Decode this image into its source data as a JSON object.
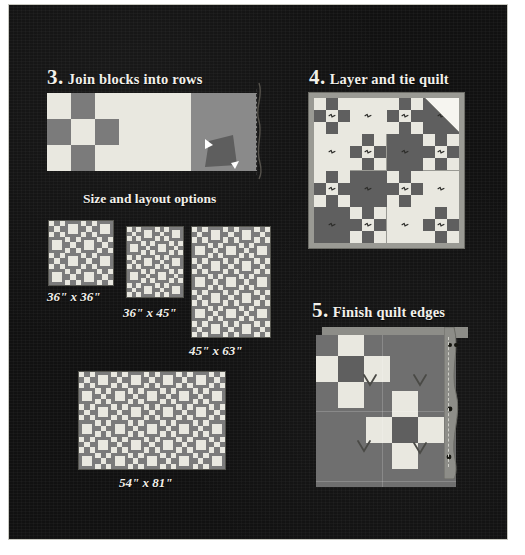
{
  "page": {
    "background_color": "#111111",
    "border_color": "#c8c8c0"
  },
  "palette": {
    "light": "#e9e8e0",
    "medium_gray": "#7b7b7b",
    "dark_gray": "#5f5f5f",
    "quilt_border": "#9a9a94",
    "white_backing": "#f6f5f0",
    "text": "#f2f0ea"
  },
  "steps": [
    {
      "id": "step3",
      "number": "3.",
      "title": "Join blocks into rows",
      "num_x": 38,
      "num_y": 60,
      "title_x": 62,
      "title_y": 64
    },
    {
      "id": "step4",
      "number": "4.",
      "title": "Layer and tie quilt",
      "num_x": 300,
      "num_y": 60,
      "title_x": 322,
      "title_y": 64
    },
    {
      "id": "step5",
      "number": "5.",
      "title": "Finish quilt edges",
      "num_x": 303,
      "num_y": 293,
      "title_x": 325,
      "title_y": 297
    }
  ],
  "section_heading": {
    "label": "Size and layout options",
    "x": 74,
    "y": 186
  },
  "chart_data": {
    "type": "diagram",
    "block_unit": "nine-patch block alternating with plain block"
  },
  "step3_strip": {
    "cells": [
      {
        "name": "nine-patch-block",
        "type": "ninepatch",
        "x": 0,
        "width": 72
      },
      {
        "name": "plain-light-block",
        "type": "plain",
        "color": "#e9e8e0",
        "x": 72,
        "width": 72
      },
      {
        "name": "gray-block-with-fold",
        "type": "fold",
        "color": "#8a8a8a",
        "x": 144,
        "width": 66
      }
    ],
    "stitch_line": "dashed seam line",
    "needle": "sewing needle with thread"
  },
  "step4_quilt": {
    "rows": 4,
    "cols": 4,
    "tie_label": "tie knot",
    "fold_corner_label": "folded-back backing corner",
    "layout": [
      [
        "nine",
        "plain",
        "nine",
        "plain"
      ],
      [
        "plain",
        "nine",
        "plain",
        "nine"
      ],
      [
        "nine",
        "plain",
        "nine",
        "plain"
      ],
      [
        "plain",
        "nine",
        "plain",
        "nine"
      ]
    ]
  },
  "size_options": [
    {
      "id": "opt1",
      "label": "36\" x 36\"",
      "rows": 4,
      "cols": 4,
      "label_x": 38,
      "label_y": 284
    },
    {
      "id": "opt2",
      "label": "36\" x 45\"",
      "rows": 5,
      "cols": 4,
      "label_x": 114,
      "label_y": 300
    },
    {
      "id": "opt3",
      "label": "45\" x 63\"",
      "rows": 7,
      "cols": 5,
      "label_x": 180,
      "label_y": 338
    },
    {
      "id": "opt4",
      "label": "54\" x 81\"",
      "rows": 6,
      "cols": 9,
      "label_x": 110,
      "label_y": 470
    }
  ],
  "step5_closeup": {
    "rows": 4,
    "cols": 4,
    "binding_label": "folded binding strip",
    "stitch_label": "dashed stitching line",
    "tie_label": "knotted tie",
    "ties": [
      {
        "x": 46,
        "y": 38
      },
      {
        "x": 96,
        "y": 38
      },
      {
        "x": 40,
        "y": 104
      },
      {
        "x": 96,
        "y": 106
      }
    ]
  }
}
